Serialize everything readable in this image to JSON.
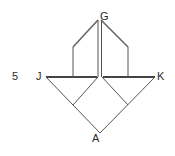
{
  "figure_number": "5",
  "labels": {
    "G": "G",
    "J": "J",
    "K": "K",
    "A": "A"
  },
  "colors": {
    "line": "#555555",
    "thick_line": "#444444",
    "text": "#2a2a2a"
  },
  "points": {
    "G": [
      99,
      19
    ],
    "J": [
      46,
      77
    ],
    "K": [
      155,
      77
    ],
    "A": [
      100,
      133
    ]
  }
}
